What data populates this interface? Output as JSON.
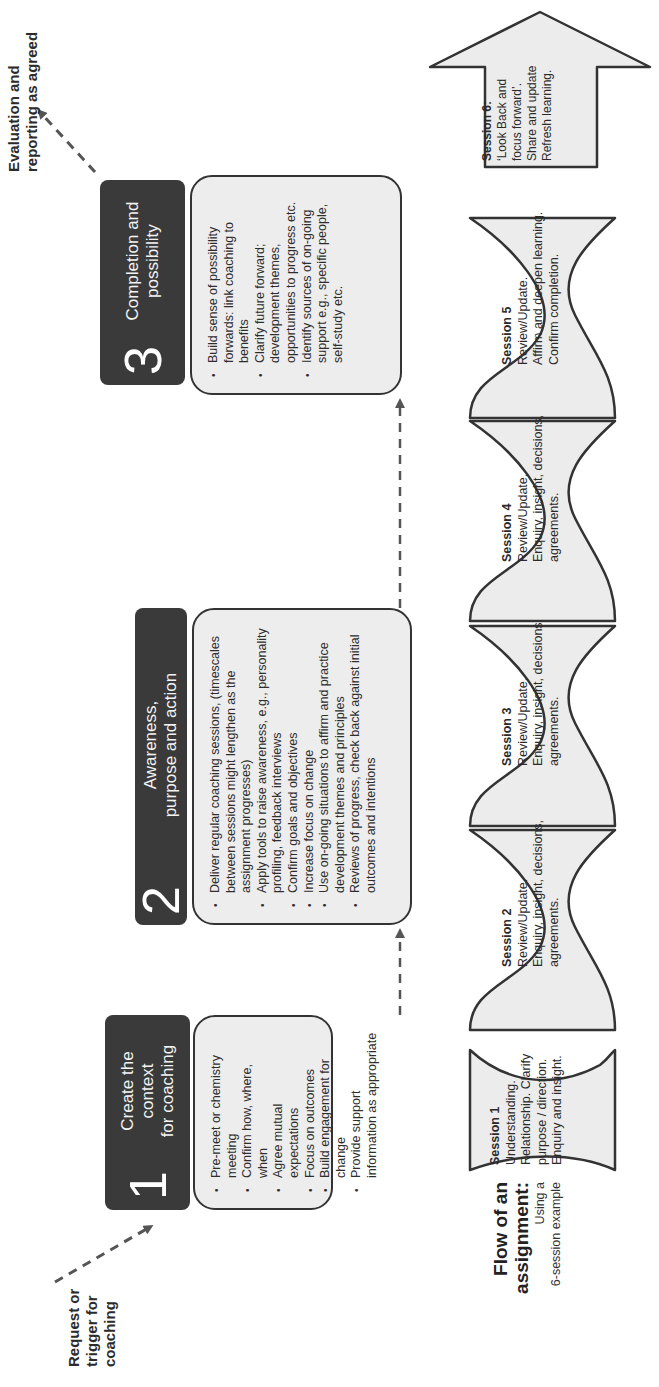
{
  "orientation": "rotated -90deg (diagram reads left-to-right when page is rotated clockwise)",
  "entry_label": "Request or trigger for coaching",
  "exit_label": "Evaluation and reporting as agreed",
  "stages": [
    {
      "number": "1",
      "title": "Create the context for coaching",
      "title_lines": [
        "Create the",
        "context",
        "for coaching"
      ],
      "bullets": [
        "Pre-meet or chemistry meeting",
        "Confirm how, where, when",
        "Agree mutual expectations",
        "Focus on outcomes",
        "Build engagement for change",
        "Provide support information as appropriate"
      ]
    },
    {
      "number": "2",
      "title": "Awareness, purpose and action",
      "title_lines": [
        "Awareness,",
        "purpose and action"
      ],
      "bullets": [
        "Deliver regular coaching sessions, (timescales between sessions might lengthen as the assignment progresses)",
        "Apply tools to raise awareness, e.g., personality profiling, feedback interviews",
        "Confirm goals and objectives",
        "Increase focus on change",
        "Use on-going situations to affirm and practice development themes and principles",
        "Reviews of progress, check back against initial outcomes and intentions"
      ]
    },
    {
      "number": "3",
      "title": "Completion and possibility",
      "title_lines": [
        "Completion and",
        "possibility"
      ],
      "bullets": [
        "Build sense of possibility forwards:  link coaching to benefits",
        "Clarify future forward; development themes, opportunities to progress etc.",
        "Identify sources of on-going support e.g., specific people, self-study etc."
      ]
    }
  ],
  "flow": {
    "title_line1": "Flow of an",
    "title_line2": "assignment:",
    "subtitle_line1": "Using a",
    "subtitle_line2": "6-session example",
    "sessions": [
      {
        "name": "Session 1",
        "lines": [
          "Understanding.",
          "Relationship. Clarify",
          "purpose / direction.",
          "Enquiry and insight."
        ]
      },
      {
        "name": "Session 2",
        "lines": [
          "Review/Update.",
          "Enquiry, insight, decisions,",
          "agreements."
        ]
      },
      {
        "name": "Session 3",
        "lines": [
          "Review/Update.",
          "Enquiry, insight, decisions,",
          "agreements."
        ]
      },
      {
        "name": "Session 4",
        "lines": [
          "Review/Update.",
          "Enquiry, insight, decisions,",
          "agreements."
        ]
      },
      {
        "name": "Session 5",
        "lines": [
          "Review/Update.",
          "Affirm and deepen learning.",
          "Confirm completion."
        ]
      },
      {
        "name": "Session 6:",
        "lines": [
          "‘Look Back and",
          "focus forward’.",
          "Share and update",
          "Refresh learning."
        ]
      }
    ]
  },
  "colors": {
    "header_bg": "#3a3a3a",
    "body_bg": "#ededed",
    "outline": "#333333",
    "arrow": "#555555"
  }
}
